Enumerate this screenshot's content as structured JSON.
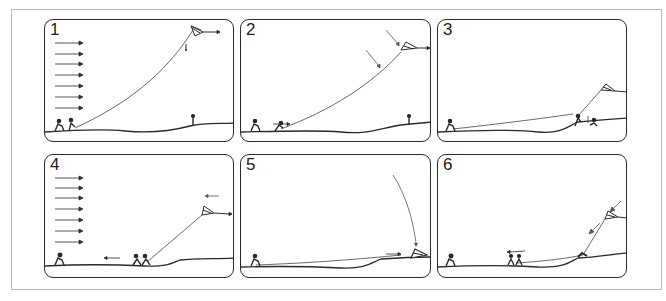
{
  "figure": {
    "line_color": "#2a2a2a",
    "frame_color": "#b8b8b8",
    "panels": [
      {
        "number": "1",
        "wind_arrows": 7,
        "wind_direction": "right",
        "caption": ""
      },
      {
        "number": "2",
        "wind_arrows": 0,
        "wind_direction": "down-right",
        "caption": ""
      },
      {
        "number": "3",
        "wind_arrows": 0,
        "wind_direction": "none",
        "caption": ""
      },
      {
        "number": "4",
        "wind_arrows": 7,
        "wind_direction": "right",
        "caption": ""
      },
      {
        "number": "5",
        "wind_arrows": 0,
        "wind_direction": "down",
        "caption": ""
      },
      {
        "number": "6",
        "wind_arrows": 0,
        "wind_direction": "down-left",
        "caption": ""
      }
    ]
  }
}
